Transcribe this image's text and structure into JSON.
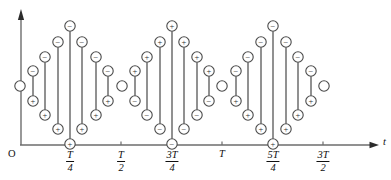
{
  "figure": {
    "title": "",
    "origin_label": "O",
    "x_axis_label": "t",
    "y_axis_label": "",
    "accent_color": "#6d6d6d",
    "node_stroke_color": "#4a4a4a",
    "text_color": "#111111",
    "plus_symbol": "+",
    "minus_symbol": "−"
  },
  "axes": {
    "x_start_px": 21,
    "x_end_px": 372,
    "baseline_y_px": 145,
    "y_top_px": 11,
    "ticks": [
      {
        "name": "t-quarter",
        "x_px": 70,
        "num": "T",
        "den": "4",
        "whole": ""
      },
      {
        "name": "t-half",
        "x_px": 121,
        "num": "T",
        "den": "2",
        "whole": ""
      },
      {
        "name": "three-t-quarter",
        "x_px": 172,
        "num": "3T",
        "den": "4",
        "whole": ""
      },
      {
        "name": "t-one",
        "x_px": 222,
        "num": "",
        "den": "",
        "whole": "T"
      },
      {
        "name": "five-t-quarter",
        "x_px": 273,
        "num": "5T",
        "den": "4",
        "whole": ""
      },
      {
        "name": "three-t-half",
        "x_px": 323,
        "num": "3T",
        "den": "2",
        "whole": ""
      }
    ]
  },
  "chart_data": {
    "type": "scatter",
    "title": "",
    "xlabel": "t",
    "ylabel": "",
    "grid": false,
    "legend": null,
    "xlim": [
      0,
      375
    ],
    "ylim": [
      145,
      11
    ],
    "xtick_positions": [
      70,
      121,
      172,
      222,
      273,
      323
    ],
    "xtick_labels": [
      "T/4",
      "T/2",
      "3T/4",
      "T",
      "5T/4",
      "3T/2"
    ],
    "radius": 5.2,
    "lone_nodes": [
      {
        "x": 20,
        "y": 86,
        "sign": ""
      },
      {
        "x": 122,
        "y": 86,
        "sign": ""
      },
      {
        "x": 222,
        "y": 86,
        "sign": ""
      },
      {
        "x": 324,
        "y": 86,
        "sign": ""
      }
    ],
    "stems": [
      {
        "x": 33,
        "top_y": 71,
        "bottom_y": 101,
        "top_sign": "−",
        "bottom_sign": "+"
      },
      {
        "x": 45,
        "top_y": 57,
        "bottom_y": 115,
        "top_sign": "−",
        "bottom_sign": "+"
      },
      {
        "x": 58,
        "top_y": 42,
        "bottom_y": 129,
        "top_sign": "−",
        "bottom_sign": "+"
      },
      {
        "x": 70,
        "top_y": 26,
        "bottom_y": 144,
        "top_sign": "−",
        "bottom_sign": "+"
      },
      {
        "x": 82,
        "top_y": 42,
        "bottom_y": 129,
        "top_sign": "−",
        "bottom_sign": "+"
      },
      {
        "x": 96,
        "top_y": 57,
        "bottom_y": 115,
        "top_sign": "−",
        "bottom_sign": "+"
      },
      {
        "x": 108,
        "top_y": 71,
        "bottom_y": 101,
        "top_sign": "−",
        "bottom_sign": "+"
      },
      {
        "x": 135,
        "top_y": 71,
        "bottom_y": 101,
        "top_sign": "+",
        "bottom_sign": "−"
      },
      {
        "x": 147,
        "top_y": 57,
        "bottom_y": 115,
        "top_sign": "+",
        "bottom_sign": "−"
      },
      {
        "x": 160,
        "top_y": 42,
        "bottom_y": 129,
        "top_sign": "+",
        "bottom_sign": "−"
      },
      {
        "x": 172,
        "top_y": 26,
        "bottom_y": 144,
        "top_sign": "+",
        "bottom_sign": "−"
      },
      {
        "x": 184,
        "top_y": 42,
        "bottom_y": 129,
        "top_sign": "+",
        "bottom_sign": "−"
      },
      {
        "x": 197,
        "top_y": 57,
        "bottom_y": 115,
        "top_sign": "+",
        "bottom_sign": "−"
      },
      {
        "x": 209,
        "top_y": 71,
        "bottom_y": 101,
        "top_sign": "+",
        "bottom_sign": "−"
      },
      {
        "x": 236,
        "top_y": 71,
        "bottom_y": 101,
        "top_sign": "−",
        "bottom_sign": "+"
      },
      {
        "x": 248,
        "top_y": 57,
        "bottom_y": 115,
        "top_sign": "−",
        "bottom_sign": "+"
      },
      {
        "x": 261,
        "top_y": 42,
        "bottom_y": 129,
        "top_sign": "−",
        "bottom_sign": "+"
      },
      {
        "x": 273,
        "top_y": 26,
        "bottom_y": 144,
        "top_sign": "−",
        "bottom_sign": "+"
      },
      {
        "x": 286,
        "top_y": 42,
        "bottom_y": 129,
        "top_sign": "−",
        "bottom_sign": "+"
      },
      {
        "x": 298,
        "top_y": 57,
        "bottom_y": 115,
        "top_sign": "−",
        "bottom_sign": "+"
      },
      {
        "x": 311,
        "top_y": 71,
        "bottom_y": 101,
        "top_sign": "−",
        "bottom_sign": "+"
      }
    ]
  }
}
